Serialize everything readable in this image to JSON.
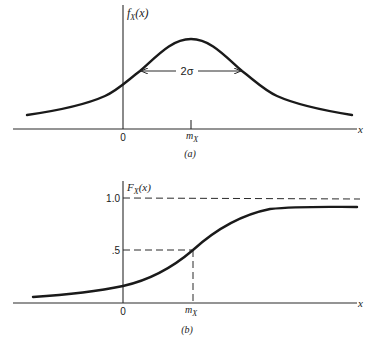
{
  "panel_a": {
    "y_label_main": "f",
    "y_label_sub": "X",
    "y_label_arg": "(x)",
    "x_label": "x",
    "origin_label": "0",
    "mean_label_main": "m",
    "mean_label_sub": "X",
    "width_label": "2σ",
    "caption": "(a)",
    "description": "Gaussian probability density function centered at m_X with width 2σ"
  },
  "panel_b": {
    "y_label_main": "F",
    "y_label_sub": "X",
    "y_label_arg": "(x)",
    "x_label": "x",
    "origin_label": "0",
    "mean_label_main": "m",
    "mean_label_sub": "X",
    "tick_one": "1.0",
    "tick_half": ".5",
    "caption": "(b)",
    "description": "Cumulative distribution function rising from 0 toward 1.0, crossing .5 at m_X"
  },
  "colors": {
    "ink": "#1a1a1a",
    "background": "#ffffff"
  }
}
